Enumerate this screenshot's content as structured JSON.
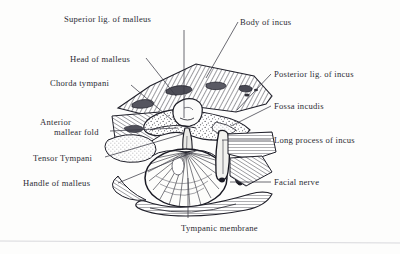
{
  "figure": {
    "background_color": "#fdfdfc",
    "ink_color": "#2b2b33",
    "rule_color": "#d8d8dc"
  },
  "labels": [
    {
      "id": "superior-lig-of-malleus",
      "text": "Superior lig. of malleus",
      "x": 64,
      "y": 14,
      "side": "top"
    },
    {
      "id": "body-of-incus",
      "text": "Body of incus",
      "x": 240,
      "y": 17,
      "side": "top-right"
    },
    {
      "id": "head-of-malleus",
      "text": "Head of malleus",
      "x": 70,
      "y": 54,
      "side": "left"
    },
    {
      "id": "chorda-tympani",
      "text": "Chorda tympani",
      "x": 50,
      "y": 78,
      "side": "left"
    },
    {
      "id": "posterior-lig-of-incus",
      "text": "Posterior lig. of incus",
      "x": 274,
      "y": 69,
      "side": "right"
    },
    {
      "id": "fossa-incudis",
      "text": "Fossa incudis",
      "x": 274,
      "y": 101,
      "side": "right"
    },
    {
      "id": "anterior-mallear-fold",
      "text": "Anterior",
      "text_line2": "mallear fold",
      "x": 40,
      "y": 117,
      "side": "left"
    },
    {
      "id": "long-process-of-incus",
      "text": "Long process of incus",
      "x": 274,
      "y": 135,
      "side": "right"
    },
    {
      "id": "tensor-tympani",
      "text": "Tensor Tympani",
      "x": 33,
      "y": 153,
      "side": "left"
    },
    {
      "id": "facial-nerve",
      "text": "Facial nerve",
      "x": 274,
      "y": 177,
      "side": "right"
    },
    {
      "id": "handle-of-malleus",
      "text": "Handle of malleus",
      "x": 23,
      "y": 178,
      "side": "left"
    },
    {
      "id": "tympanic-membrane",
      "text": "Tympanic membrane",
      "x": 181,
      "y": 223,
      "side": "bottom"
    }
  ],
  "leader_lines": [
    {
      "id": "leader-superior-lig-of-malleus",
      "points": "184,30 184,118"
    },
    {
      "id": "leader-body-of-incus",
      "points": "238,22 206,78"
    },
    {
      "id": "leader-head-of-malleus",
      "points": "146,58 176,96"
    },
    {
      "id": "leader-chorda-tympani",
      "points": "131,85 172,120"
    },
    {
      "id": "leader-posterior-lig-of-incus",
      "points": "271,74 237,110"
    },
    {
      "id": "leader-fossa-incudis",
      "points": "271,106 231,126"
    },
    {
      "id": "leader-anterior-mallear-fold",
      "points": "110,131 178,128"
    },
    {
      "id": "leader-long-process-of-incus",
      "points": "271,140 222,140"
    },
    {
      "id": "leader-tensor-tympani",
      "points": "105,157 183,134"
    },
    {
      "id": "leader-facial-nerve",
      "points": "271,182 230,182"
    },
    {
      "id": "leader-handle-of-malleus",
      "points": "118,183 198,150"
    },
    {
      "id": "leader-tympanic-membrane",
      "points": "188,218 188,178"
    }
  ],
  "illustration": {
    "name": "ear-ossicles-engraving",
    "regions": [
      {
        "id": "temporal-bone-hatched-band",
        "style": "diagonal-hatching"
      },
      {
        "id": "stippled-bone-mass",
        "style": "stipple"
      },
      {
        "id": "tympanic-membrane-disc",
        "style": "radiating-fibers"
      },
      {
        "id": "long-process-incus-shaft",
        "style": "solid-outline"
      },
      {
        "id": "facial-nerve-canal",
        "style": "filled-oval"
      },
      {
        "id": "bony-ridge-lower",
        "style": "horizontal-hatching"
      }
    ]
  },
  "footer_rule": {
    "id": "bottom-rule",
    "y": 241
  }
}
